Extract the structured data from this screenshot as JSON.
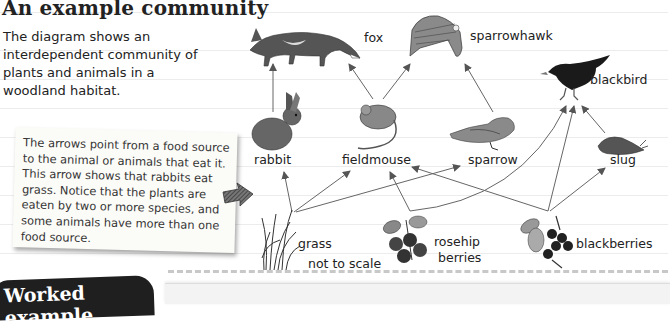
{
  "title": "An example community",
  "intro": "The diagram shows an interdependent community of plants and animals in a woodland habitat.",
  "note": "The arrows point from a food source to the animal or animals that eat it. This arrow shows that rabbits eat grass. Notice that the plants are eaten by two or more species, and some animals have more than one food source.",
  "organisms": {
    "fox": "fox",
    "sparrowhawk": "sparrowhawk",
    "blackbird": "blackbird",
    "rabbit": "rabbit",
    "fieldmouse": "fieldmouse",
    "sparrow": "sparrow",
    "slug": "slug",
    "grass": "grass",
    "rosehip_berries": "rosehip berries",
    "rosehip_line1": "rosehip",
    "rosehip_line2": "berries",
    "blackberries": "blackberries"
  },
  "food_web": [
    {
      "from": "grass",
      "to": "rabbit"
    },
    {
      "from": "grass",
      "to": "fieldmouse"
    },
    {
      "from": "grass",
      "to": "sparrow"
    },
    {
      "from": "rosehip berries",
      "to": "fieldmouse"
    },
    {
      "from": "rosehip berries",
      "to": "blackbird"
    },
    {
      "from": "blackberries",
      "to": "fieldmouse"
    },
    {
      "from": "blackberries",
      "to": "blackbird"
    },
    {
      "from": "blackberries",
      "to": "slug"
    },
    {
      "from": "rabbit",
      "to": "fox"
    },
    {
      "from": "fieldmouse",
      "to": "fox"
    },
    {
      "from": "fieldmouse",
      "to": "sparrowhawk"
    },
    {
      "from": "sparrow",
      "to": "sparrowhawk"
    },
    {
      "from": "slug",
      "to": "blackbird"
    }
  ],
  "scale_note": "not to scale",
  "worked_example": "Worked example",
  "colors": {
    "arrow": "#555555",
    "title": "#222222",
    "worked_bg": "#1f1f1f"
  }
}
